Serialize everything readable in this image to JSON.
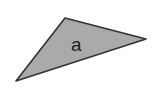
{
  "diagram": {
    "shape": "triangle",
    "label": "a",
    "fill": "#aaaaaa",
    "stroke": "#333333",
    "vertices": [
      [
        65,
        18
      ],
      [
        146,
        39
      ],
      [
        16,
        81
      ]
    ]
  }
}
